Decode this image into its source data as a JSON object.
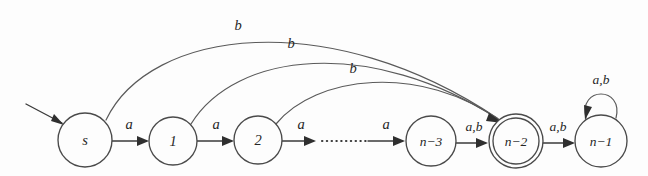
{
  "figure": {
    "kind": "finite-automaton-state-diagram",
    "background_color": "#fdfdfd",
    "ink_color": "#2f2f2f"
  },
  "states": [
    {
      "id": "s",
      "label": "s",
      "cx": 85,
      "cy": 140,
      "r": 27,
      "accepting": false,
      "start": true
    },
    {
      "id": "1",
      "label": "1",
      "cx": 173,
      "cy": 141,
      "r": 24,
      "accepting": false,
      "start": false
    },
    {
      "id": "2",
      "label": "2",
      "cx": 258,
      "cy": 140,
      "r": 24,
      "accepting": false,
      "start": false
    },
    {
      "id": "n-3",
      "label": "n−3",
      "cx": 431,
      "cy": 141,
      "r": 25,
      "accepting": false,
      "start": false
    },
    {
      "id": "n-2",
      "label": "n−2",
      "cx": 516,
      "cy": 141,
      "r": 27,
      "accepting": true,
      "start": false
    },
    {
      "id": "n-1",
      "label": "n−1",
      "cx": 601,
      "cy": 141,
      "r": 26,
      "accepting": false,
      "start": false
    }
  ],
  "start_arrow": {
    "name": "start-arrow",
    "from": {
      "x": 26,
      "y": 104
    },
    "to": {
      "x": 64,
      "y": 125
    }
  },
  "transitions": [
    {
      "name": "edge-s-to-1",
      "from": "s",
      "to": "1",
      "label": "a",
      "shape": "straight",
      "label_x": 129,
      "label_y": 126
    },
    {
      "name": "edge-1-to-2",
      "from": "1",
      "to": "2",
      "label": "a",
      "shape": "straight",
      "label_x": 216,
      "label_y": 126
    },
    {
      "name": "edge-2-to-dots",
      "from": "2",
      "to": "dots",
      "label": "a",
      "shape": "straight",
      "label_x": 301,
      "label_y": 126
    },
    {
      "name": "edge-dots-to-n-3",
      "from": "dots",
      "to": "n-3",
      "label": "a",
      "shape": "straight",
      "label_x": 386,
      "label_y": 126
    },
    {
      "name": "edge-n-3-to-n-2",
      "from": "n-3",
      "to": "n-2",
      "label": "a,b",
      "shape": "straight",
      "label_x": 474,
      "label_y": 128
    },
    {
      "name": "edge-n-2-to-n-1",
      "from": "n-2",
      "to": "n-1",
      "label": "a,b",
      "shape": "straight",
      "label_x": 558,
      "label_y": 128
    },
    {
      "name": "edge-s-to-n-2",
      "from": "s",
      "to": "n-2",
      "label": "b",
      "shape": "arc",
      "label_x": 238,
      "label_y": 27
    },
    {
      "name": "edge-1-to-n-2",
      "from": "1",
      "to": "n-2",
      "label": "b",
      "shape": "arc",
      "label_x": 291,
      "label_y": 45
    },
    {
      "name": "edge-2-to-n-2",
      "from": "2",
      "to": "n-2",
      "label": "b",
      "shape": "arc",
      "label_x": 353,
      "label_y": 70
    },
    {
      "name": "edge-n-1-self",
      "from": "n-1",
      "to": "n-1",
      "label": "a,b",
      "shape": "self-loop",
      "label_x": 601,
      "label_y": 81
    }
  ],
  "dots_segment": {
    "name": "ellipsis-dotted-segment",
    "x1": 320,
    "y1": 141,
    "x2": 366,
    "y2": 141
  }
}
